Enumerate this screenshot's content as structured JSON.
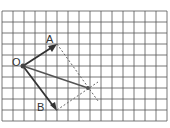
{
  "diagram": {
    "type": "vector-addition-parallelogram",
    "grid": {
      "origin_px": [
        2,
        11
      ],
      "cell_px": 11,
      "cols": 15,
      "rows": 10,
      "line_color": "#555555"
    },
    "points": {
      "O": {
        "label": "O",
        "grid": [
          2,
          5
        ]
      },
      "A": {
        "label": "A",
        "grid": [
          5,
          3
        ]
      },
      "B": {
        "label": "B",
        "grid": [
          5,
          9
        ]
      },
      "R": {
        "label": "",
        "grid": [
          8,
          7
        ]
      }
    },
    "vectors": [
      {
        "name": "OA",
        "from": "O",
        "to": "A",
        "style": "solid-arrow"
      },
      {
        "name": "OB",
        "from": "O",
        "to": "B",
        "style": "solid-arrow"
      },
      {
        "name": "OR",
        "from": "O",
        "to": "R",
        "style": "solid"
      }
    ],
    "dashed": [
      {
        "name": "A-R",
        "from": "A",
        "to": "R"
      },
      {
        "name": "B-R",
        "from": "B",
        "to": "R"
      }
    ],
    "colors": {
      "vector": "#333333",
      "resultant": "#555555",
      "dashed": "#666666",
      "label": "#333333"
    }
  }
}
